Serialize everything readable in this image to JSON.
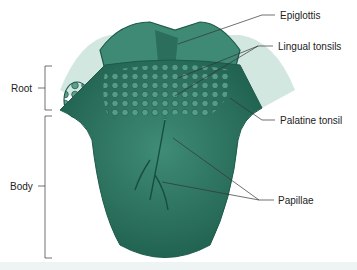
{
  "diagram": {
    "colors": {
      "tongue": "#2e7d68",
      "tongue_dark": "#1d5a4a",
      "tongue_light": "#5aa08a",
      "line": "#333333"
    },
    "labels": {
      "epiglottis": "Epiglottis",
      "lingual_tonsils": "Lingual tonsils",
      "palatine_tonsil": "Palatine tonsil",
      "papillae": "Papillae",
      "root": "Root",
      "body": "Body"
    }
  }
}
